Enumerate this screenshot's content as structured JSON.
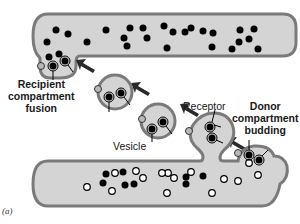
{
  "labels": {
    "recipient": [
      "Recipient",
      "compartment",
      "fusion"
    ],
    "donor": [
      "Donor",
      "compartment",
      "budding"
    ],
    "receptor": "Receptor",
    "vesicle": "Vesicle",
    "panel": "(a)"
  },
  "colors": {
    "membrane": "#7a7a7a",
    "lumen": "#d4d4d4",
    "cargo": "#000000",
    "receptor_gray": "#b8b8b8",
    "unsorted_white": "#ffffff",
    "arrow": "#2a2a2a"
  }
}
